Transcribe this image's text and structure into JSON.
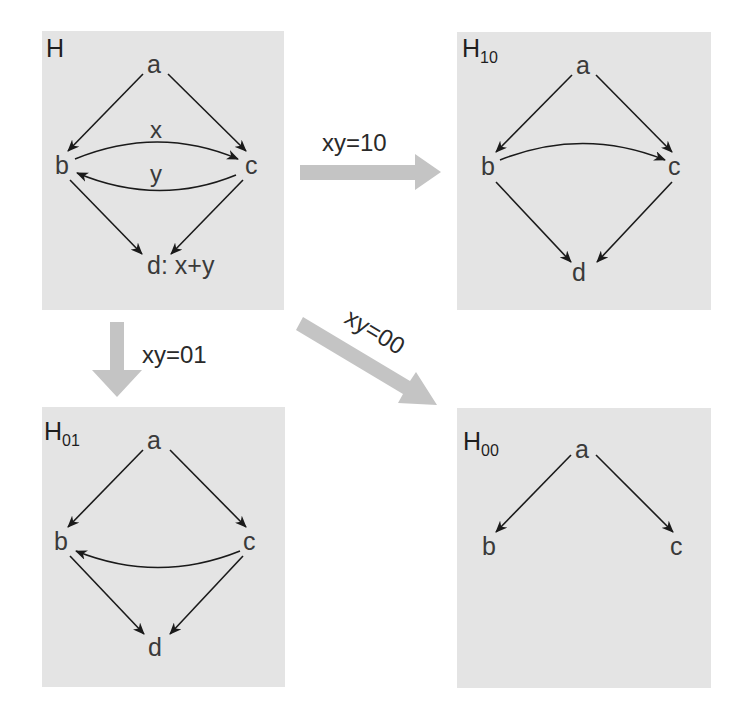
{
  "colors": {
    "panel_background": "#e4e4e4",
    "edge": "#1a1a1a",
    "transition_arrow": "#c4c4c4",
    "text": "#3a3a3a"
  },
  "panels": {
    "H": {
      "title": "H",
      "subscript": "",
      "nodes": {
        "a": "a",
        "b": "b",
        "c": "c",
        "d": "d: x+y"
      },
      "edges": [
        {
          "from": "a",
          "to": "b"
        },
        {
          "from": "a",
          "to": "c"
        },
        {
          "from": "b",
          "to": "c",
          "label": "x"
        },
        {
          "from": "c",
          "to": "b",
          "label": "y"
        },
        {
          "from": "b",
          "to": "d"
        },
        {
          "from": "c",
          "to": "d"
        }
      ],
      "edge_labels": {
        "x": "x",
        "y": "y"
      }
    },
    "H10": {
      "title": "H",
      "subscript": "10",
      "nodes": {
        "a": "a",
        "b": "b",
        "c": "c",
        "d": "d"
      },
      "edges": [
        {
          "from": "a",
          "to": "b"
        },
        {
          "from": "a",
          "to": "c"
        },
        {
          "from": "b",
          "to": "c"
        },
        {
          "from": "b",
          "to": "d"
        },
        {
          "from": "c",
          "to": "d"
        }
      ]
    },
    "H01": {
      "title": "H",
      "subscript": "01",
      "nodes": {
        "a": "a",
        "b": "b",
        "c": "c",
        "d": "d"
      },
      "edges": [
        {
          "from": "a",
          "to": "b"
        },
        {
          "from": "a",
          "to": "c"
        },
        {
          "from": "c",
          "to": "b"
        },
        {
          "from": "b",
          "to": "d"
        },
        {
          "from": "c",
          "to": "d"
        }
      ]
    },
    "H00": {
      "title": "H",
      "subscript": "00",
      "nodes": {
        "a": "a",
        "b": "b",
        "c": "c"
      },
      "edges": [
        {
          "from": "a",
          "to": "b"
        },
        {
          "from": "a",
          "to": "c"
        }
      ]
    }
  },
  "transitions": {
    "to_H10": {
      "label": "xy=10",
      "direction": "right"
    },
    "to_H01": {
      "label": "xy=01",
      "direction": "down"
    },
    "to_H00": {
      "label": "xy=00",
      "direction": "diagonal-down-right"
    }
  }
}
